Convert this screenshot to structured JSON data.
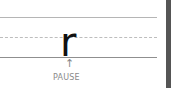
{
  "guide": {
    "letter": "r",
    "arrow": "↑",
    "label": "PAUSE"
  },
  "colors": {
    "letter": "#111111",
    "lines": "#b5b5b5",
    "edge": "#555555"
  }
}
